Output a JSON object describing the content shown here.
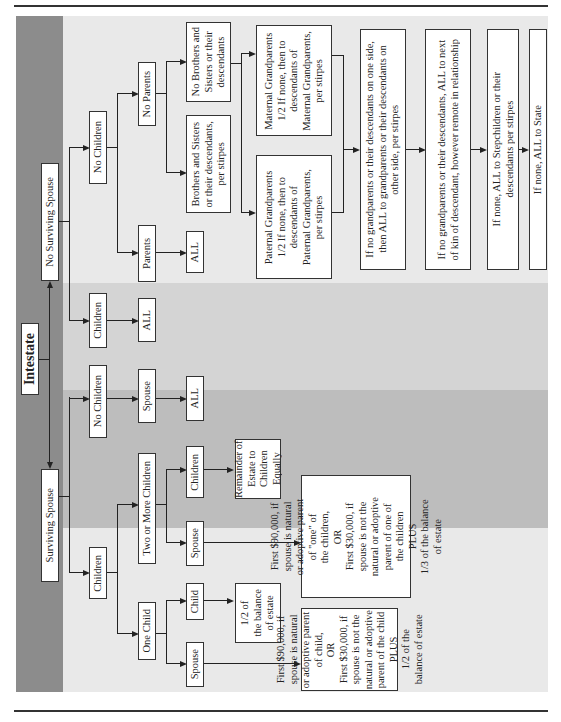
{
  "diagram": {
    "title": "Intestate",
    "branches": {
      "no_spouse": "No Surviving Spouse",
      "spouse": "Surviving Spouse"
    },
    "no_spouse": {
      "no_children": "No Children",
      "children": "Children",
      "children_all": "ALL",
      "parents": "Parents",
      "parents_all": "ALL",
      "no_parents": "No Parents",
      "siblings": "Brothers and Sisters\nor their descendants,\nper stirpes",
      "no_siblings": "No Brothers and\nSisters or their\ndescendants",
      "maternal": "Maternal Grandparents\n1/2  If none, then to\ndescendants of\nMaternal Grandparents,\nper stirpes",
      "paternal": "Paternal Grandparents\n1/2  If none, then to\ndescendants of\nPaternal Grandparents,\nper stirpes",
      "step1": "If no grandparents or their descendants on one side,\nthen ALL to grandparents or their descendants on\nother side, per stirpes",
      "step2": "If no grandparents or their descendants, ALL to next\nof kin of descendant, however remote in relationship",
      "step3": "If none, ALL to Stepchildren or their\ndescendants per stirpes",
      "step4": "If none, ALL to State"
    },
    "spouse": {
      "no_children": "No Children",
      "spouse": "Spouse",
      "spouse_all": "ALL",
      "children": "Children",
      "two_or_more": "Two or More Children",
      "one_child": "One Child",
      "tm_children": "Children",
      "tm_spouse": "Spouse",
      "remainder": "Remainder of\nEstate to\nChildren Equally",
      "tm_spouse_share": "First $90,000, if\nspouse is natural\nor adoptive parent\nof \"one\" of\nthe children,\nOR\nFirst $30,000, if\nspouse is not the\nnatural or adoptive\nparent of one of\nthe children\nPLUS\n1/3 of the balance\nof estate",
      "oc_child": "Child",
      "oc_spouse": "Spouse",
      "oc_child_share": "1/2  of\nthe balance\nof estate",
      "oc_spouse_share": "First $90,000, if\nspouse is natural\nor adoptive parent\nof child,\nOR\nFirst $30,000, if\nspouse is not the\nnatural or adoptive\nparent of the child\nPLUS\n1/2 of the\nbalance of estate"
    },
    "colors": {
      "panel": "#e9e9e9",
      "strip": "#8c8c8c",
      "band_mid": "#d4d4d4",
      "band_dark": "#bdbdbd"
    }
  }
}
